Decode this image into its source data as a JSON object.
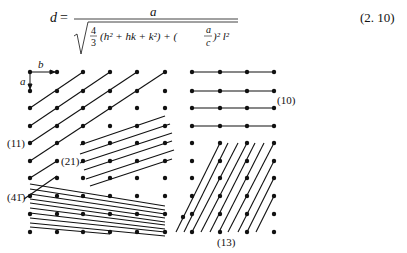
{
  "equation": {
    "lhs": "d",
    "equals": "=",
    "numerator": "a",
    "frac_num": "4",
    "frac_den": "3",
    "term1": "(h² + hk + k²) + (",
    "ratio_num": "a",
    "ratio_den": "c",
    "term2": ")² l²",
    "number": "(2. 10)"
  },
  "figure": {
    "axis_labels": {
      "a": "a",
      "b": "b"
    },
    "plane_labels": {
      "p11": "(11)",
      "p21": "(21)",
      "p41bar": "(41̄)",
      "p10": "(10)",
      "p13": "(13)"
    },
    "lattice": {
      "columns_x": [
        30,
        57,
        83,
        110,
        137,
        165,
        192,
        220,
        247,
        274
      ],
      "rows_y": [
        72,
        91,
        108,
        126,
        143,
        161,
        178,
        196,
        214,
        232
      ]
    }
  }
}
